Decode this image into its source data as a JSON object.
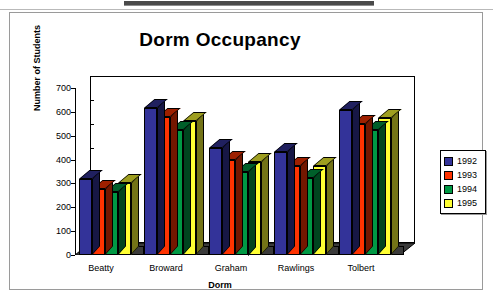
{
  "chart_data": {
    "type": "bar",
    "title": "Dorm Occupancy",
    "xlabel": "Dorm",
    "ylabel": "Number of Students",
    "categories": [
      "Beatty",
      "Broward",
      "Graham",
      "Rawlings",
      "Tolbert"
    ],
    "series": [
      {
        "name": "1992",
        "color": "#333399",
        "values": [
          320,
          615,
          448,
          432,
          608
        ]
      },
      {
        "name": "1993",
        "color": "#FF3300",
        "values": [
          275,
          578,
          398,
          375,
          550
        ]
      },
      {
        "name": "1994",
        "color": "#009944",
        "values": [
          263,
          522,
          350,
          323,
          522
        ]
      },
      {
        "name": "1995",
        "color": "#FFFF33",
        "values": [
          300,
          562,
          388,
          372,
          575
        ]
      }
    ],
    "ylim": [
      0,
      700
    ],
    "yticks": [
      0,
      100,
      200,
      300,
      400,
      500,
      600,
      700
    ],
    "ytick_labels": [
      "0",
      "100",
      "200",
      "300",
      "400",
      "500",
      "600",
      "700"
    ],
    "grid": false,
    "legend_position": "right",
    "style": "3d-clustered-column"
  },
  "legend": {
    "entries": [
      {
        "label": "1992",
        "color": "#333399"
      },
      {
        "label": "1993",
        "color": "#FF3300"
      },
      {
        "label": "1994",
        "color": "#009944"
      },
      {
        "label": "1995",
        "color": "#FFFF33"
      }
    ]
  }
}
